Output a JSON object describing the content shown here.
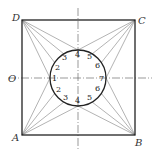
{
  "diagram": {
    "type": "geometric construction",
    "corner_labels": {
      "top_left": "D",
      "top_right": "C",
      "bottom_left": "A",
      "bottom_right": "B",
      "left_axis": "O"
    },
    "circle_labels": {
      "upper_left": [
        "3",
        "2"
      ],
      "top": "4",
      "upper_right": [
        "5",
        "6"
      ],
      "left": "1",
      "right": "7",
      "lower_left": [
        "2",
        "3"
      ],
      "bottom": "4",
      "lower_right": [
        "6",
        "5"
      ]
    }
  }
}
